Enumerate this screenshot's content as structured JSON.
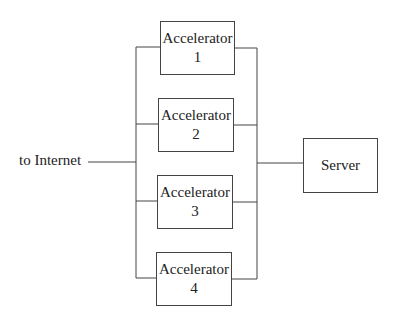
{
  "diagram": {
    "internet_label": "to Internet",
    "server_label": "Server",
    "accelerators": [
      {
        "name": "Accelerator",
        "number": "1"
      },
      {
        "name": "Accelerator",
        "number": "2"
      },
      {
        "name": "Accelerator",
        "number": "3"
      },
      {
        "name": "Accelerator",
        "number": "4"
      }
    ]
  }
}
